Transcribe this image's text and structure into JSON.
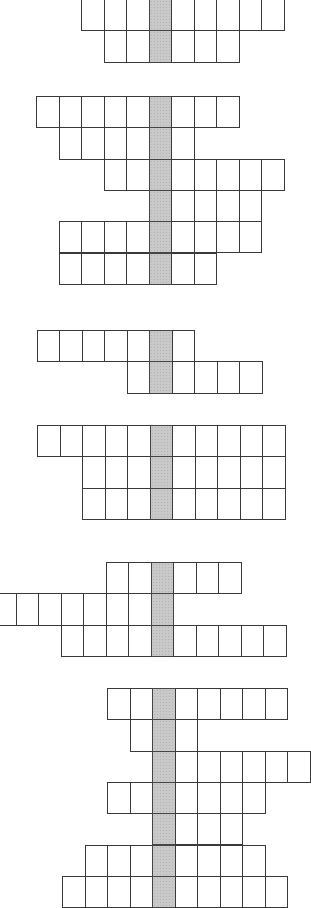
{
  "cell": {
    "width": 22.5,
    "height": 31.3
  },
  "colors": {
    "line": "#3a3a3a",
    "key_column": "#c9c9c9",
    "background": "#ffffff"
  },
  "grids": [
    {
      "id": "grid-1",
      "top": -1,
      "key_x": 148.5,
      "rows": [
        {
          "start_col": -3,
          "count": 9
        },
        {
          "start_col": -2,
          "count": 6
        }
      ]
    },
    {
      "id": "grid-2",
      "top": 96,
      "key_x": 148.5,
      "rows": [
        {
          "start_col": -5,
          "count": 9
        },
        {
          "start_col": -4,
          "count": 6
        },
        {
          "start_col": -2,
          "count": 8
        },
        {
          "start_col": 0,
          "count": 5
        },
        {
          "start_col": -4,
          "count": 9
        },
        {
          "start_col": -4,
          "count": 7
        }
      ]
    },
    {
      "id": "grid-3",
      "top": 330,
      "key_x": 149,
      "rows": [
        {
          "start_col": -5,
          "count": 7
        },
        {
          "start_col": -1,
          "count": 6
        }
      ]
    },
    {
      "id": "grid-4",
      "top": 425,
      "key_x": 149.5,
      "rows": [
        {
          "start_col": -5,
          "count": 11
        },
        {
          "start_col": -3,
          "count": 9
        },
        {
          "start_col": -3,
          "count": 9
        }
      ]
    },
    {
      "id": "grid-5",
      "top": 562,
      "key_x": 150.5,
      "rows": [
        {
          "start_col": -2,
          "count": 6
        },
        {
          "start_col": -7,
          "count": 8
        },
        {
          "start_col": -4,
          "count": 10
        }
      ]
    },
    {
      "id": "grid-6",
      "top": 688,
      "key_x": 152,
      "rows": [
        {
          "start_col": -2,
          "count": 8
        },
        {
          "start_col": -1,
          "count": 3
        },
        {
          "start_col": 0,
          "count": 7
        },
        {
          "start_col": -2,
          "count": 7
        },
        {
          "start_col": 0,
          "count": 4
        },
        {
          "start_col": -3,
          "count": 8
        },
        {
          "start_col": -4,
          "count": 10
        }
      ]
    }
  ]
}
